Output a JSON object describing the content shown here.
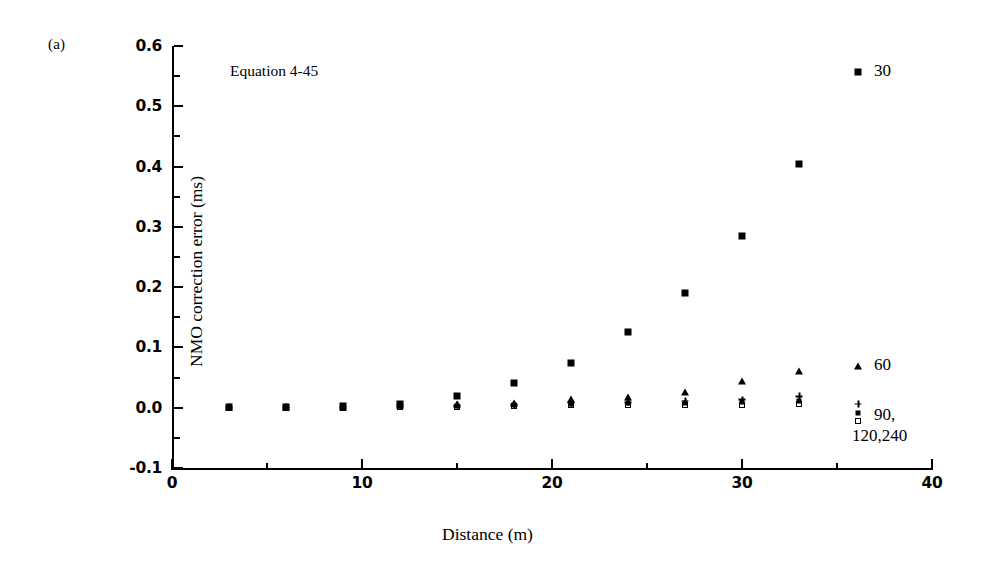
{
  "figure": {
    "panel_letter": "(a)",
    "annotation": "Equation 4-45"
  },
  "chart_data": {
    "type": "scatter",
    "title": "",
    "xlabel": "Distance (m)",
    "ylabel": "NMO correction error (ms)",
    "xlim": [
      0,
      40
    ],
    "ylim": [
      -0.1,
      0.6
    ],
    "xticks": [
      0,
      10,
      20,
      30,
      40
    ],
    "xticklabels": [
      "0",
      "10",
      "20",
      "30",
      "40"
    ],
    "yticks": [
      -0.1,
      0.0,
      0.1,
      0.2,
      0.3,
      0.4,
      0.5,
      0.6
    ],
    "yticklabels": [
      "-0.1",
      "0.0",
      "0.1",
      "0.2",
      "0.3",
      "0.4",
      "0.5",
      "0.6"
    ],
    "x_minor_interval": 5,
    "y_minor_interval": 0.05,
    "grid": false,
    "legend_position": "right-inside",
    "x": [
      3,
      6,
      9,
      12,
      15,
      18,
      21,
      24,
      27,
      30,
      33
    ],
    "series": [
      {
        "name": "30",
        "marker": "filled-square",
        "values": [
          0.002,
          0.002,
          0.003,
          0.006,
          0.019,
          0.041,
          0.075,
          0.125,
          0.191,
          0.285,
          0.405
        ]
      },
      {
        "name": "60",
        "marker": "filled-triangle",
        "values": [
          0.001,
          0.001,
          0.001,
          0.004,
          0.006,
          0.008,
          0.014,
          0.018,
          0.026,
          0.045,
          0.061
        ]
      },
      {
        "name": "90",
        "marker": "plus",
        "values": [
          0.001,
          0.001,
          0.001,
          0.003,
          0.004,
          0.005,
          0.008,
          0.009,
          0.011,
          0.013,
          0.019
        ]
      },
      {
        "name": "120",
        "marker": "filled-square-small",
        "values": [
          0.001,
          0.001,
          0.001,
          0.003,
          0.003,
          0.004,
          0.006,
          0.007,
          0.008,
          0.009,
          0.011
        ]
      },
      {
        "name": "240",
        "marker": "open-square",
        "values": [
          0.0,
          0.0,
          0.0,
          0.002,
          0.002,
          0.003,
          0.004,
          0.004,
          0.005,
          0.005,
          0.006
        ]
      }
    ],
    "legend": [
      {
        "label": "30",
        "marker": "filled-square"
      },
      {
        "label": "60",
        "marker": "filled-triangle"
      },
      {
        "label": "90,",
        "label2": "120,240",
        "marker": "stacked-group"
      }
    ]
  }
}
